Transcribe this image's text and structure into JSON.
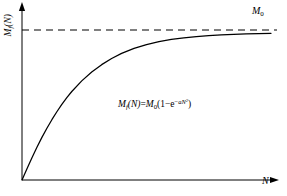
{
  "figure": {
    "background_color": "#ffffff",
    "line_color": "#000000"
  },
  "axes": {
    "y_label": "M_f (N)",
    "y_label_parts": {
      "base": "M",
      "sub": "f",
      "arg": "(N)"
    },
    "x_label": "N",
    "y_axis_arrow": true,
    "x_axis_arrow": true,
    "grid": false
  },
  "annotations": {
    "asymptote_label": "M₀",
    "asymptote_parts": {
      "base": "M",
      "sub": "0"
    },
    "equation": "M_f (N)=M₀(1−e^(−aN²))",
    "equation_parts": {
      "lhs_base": "M",
      "lhs_sub": "f",
      "lhs_arg": "(N)",
      "equals": "=",
      "rhs_base": "M",
      "rhs_sub": "0",
      "open": "(1−e",
      "exp_minus": "−",
      "exp_coef": "a",
      "exp_var": "N",
      "exp_pow": "2",
      "close": ")"
    }
  },
  "chart_data": {
    "type": "line",
    "title": "",
    "xlabel": "N",
    "ylabel": "M_f (N)",
    "xlim": [
      0,
      1
    ],
    "ylim": [
      0,
      1.08
    ],
    "grid": false,
    "legend": null,
    "series": [
      {
        "name": "M_f(N)=M0(1-exp(-a N^2))",
        "style": "solid",
        "color": "#000000",
        "x": [
          0.0,
          0.02,
          0.04,
          0.06,
          0.08,
          0.1,
          0.12,
          0.14,
          0.16,
          0.18,
          0.2,
          0.24,
          0.28,
          0.32,
          0.36,
          0.4,
          0.45,
          0.5,
          0.55,
          0.6,
          0.65,
          0.7,
          0.75,
          0.8,
          0.85,
          0.9,
          0.95,
          1.0
        ],
        "y": [
          0.0,
          0.075,
          0.148,
          0.218,
          0.284,
          0.345,
          0.402,
          0.455,
          0.504,
          0.549,
          0.59,
          0.661,
          0.72,
          0.769,
          0.81,
          0.844,
          0.878,
          0.903,
          0.922,
          0.937,
          0.948,
          0.956,
          0.962,
          0.967,
          0.971,
          0.974,
          0.976,
          0.978
        ]
      },
      {
        "name": "asymptote M0",
        "style": "dashed",
        "color": "#000000",
        "x": [
          0,
          1
        ],
        "y": [
          1.0,
          1.0
        ]
      }
    ],
    "asymptote": {
      "value": 1.0,
      "label": "M₀",
      "style": "dashed"
    }
  }
}
